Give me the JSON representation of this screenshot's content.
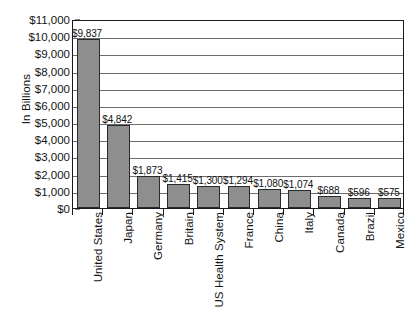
{
  "chart_data": {
    "type": "bar",
    "title": "",
    "xlabel": "",
    "ylabel": "In Billions",
    "ylim": [
      0,
      11000
    ],
    "ytick_step": 1000,
    "grid": true,
    "legend": "none",
    "orientation": "vertical",
    "bar_color": "#8e8e8e",
    "bar_edge_color": "#2a2a2a",
    "axis_color": "#1a1a1a",
    "categories": [
      "United States",
      "Japan",
      "Germany",
      "Britain",
      "US Health System",
      "France",
      "China",
      "Italy",
      "Canada",
      "Brazil",
      "Mexico"
    ],
    "values": [
      9837,
      4842,
      1873,
      1415,
      1300,
      1294,
      1080,
      1074,
      688,
      596,
      575
    ],
    "value_labels": [
      "$9,837",
      "$4,842",
      "$1,873",
      "$1,415",
      "$1,300",
      "$1,294",
      "$1,080",
      "$1,074",
      "$688",
      "$596",
      "$575"
    ],
    "ytick_labels": [
      "$0",
      "$1,000",
      "$2,000",
      "$3,000",
      "$4,000",
      "$5,000",
      "$6,000",
      "$7,000",
      "$8,000",
      "$9,000",
      "$10,000",
      "$11,000"
    ],
    "ytick_values": [
      0,
      1000,
      2000,
      3000,
      4000,
      5000,
      6000,
      7000,
      8000,
      9000,
      10000,
      11000
    ]
  }
}
